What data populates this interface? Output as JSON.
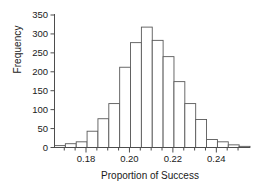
{
  "chart_data": {
    "type": "bar",
    "title": "",
    "subtitle": "",
    "xlabel": "Proportion of Success",
    "ylabel": "Frequency",
    "xlim": [
      0.1655,
      0.2555
    ],
    "ylim": [
      0,
      350
    ],
    "grid": false,
    "legend": null,
    "bin_width": 0.005,
    "bin_edges": [
      0.1655,
      0.1705,
      0.1755,
      0.1805,
      0.1855,
      0.1905,
      0.1955,
      0.2005,
      0.2055,
      0.2105,
      0.2155,
      0.2205,
      0.2255,
      0.2305,
      0.2355,
      0.2405,
      0.2455,
      0.2505,
      0.2555
    ],
    "bin_centers": [
      0.168,
      0.173,
      0.178,
      0.183,
      0.188,
      0.193,
      0.198,
      0.203,
      0.208,
      0.213,
      0.218,
      0.223,
      0.228,
      0.233,
      0.238,
      0.243,
      0.248,
      0.253
    ],
    "values": [
      5,
      10,
      15,
      43,
      76,
      116,
      212,
      277,
      318,
      283,
      240,
      174,
      116,
      74,
      21,
      15,
      7,
      3
    ],
    "bar_fill": "#ffffff",
    "bar_stroke": "#595959",
    "axis_color": "#4d4d4d",
    "x_ticks_major": [
      0.18,
      0.2,
      0.22,
      0.24
    ],
    "x_tick_labels": [
      "0.18",
      "0.20",
      "0.22",
      "0.24"
    ],
    "x_ticks_minor": [
      0.17,
      0.175,
      0.185,
      0.19,
      0.195,
      0.205,
      0.21,
      0.215,
      0.225,
      0.23,
      0.235,
      0.245,
      0.25
    ],
    "y_ticks": [
      0,
      50,
      100,
      150,
      200,
      250,
      300,
      350
    ],
    "y_tick_labels": [
      "0",
      "50",
      "100",
      "150",
      "200",
      "250",
      "300",
      "350"
    ]
  }
}
